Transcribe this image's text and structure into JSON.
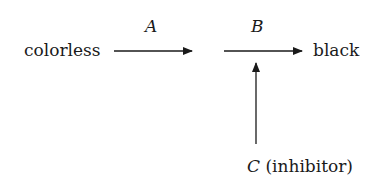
{
  "diagram": {
    "start_label": "colorless",
    "end_label": "black",
    "step1_label": "A",
    "step2_label": "B",
    "inhibitor_symbol": "C",
    "inhibitor_text": "(inhibitor)"
  }
}
